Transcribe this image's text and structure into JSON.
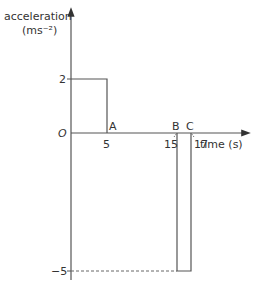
{
  "diagram": {
    "type": "acceleration-time graph",
    "y_axis": {
      "label": "acceleration",
      "unit": "(ms⁻²)"
    },
    "x_axis": {
      "label": "time (s)"
    },
    "origin_label": "O",
    "y_ticks": [
      {
        "value": 2,
        "label": "2"
      },
      {
        "value": -5,
        "label": "−5"
      }
    ],
    "x_ticks": [
      {
        "value": 5,
        "label": "5"
      },
      {
        "value": 15,
        "label": "15"
      },
      {
        "value": 17,
        "label": "17"
      }
    ],
    "points": [
      {
        "label": "A",
        "t": 5
      },
      {
        "label": "B",
        "t": 15
      },
      {
        "label": "C",
        "t": 17
      }
    ],
    "segments": [
      {
        "from_t": 0,
        "to_t": 5,
        "acceleration": 2
      },
      {
        "from_t": 5,
        "to_t": 15,
        "acceleration": 0
      },
      {
        "from_t": 15,
        "to_t": 17,
        "acceleration": -5
      }
    ]
  }
}
